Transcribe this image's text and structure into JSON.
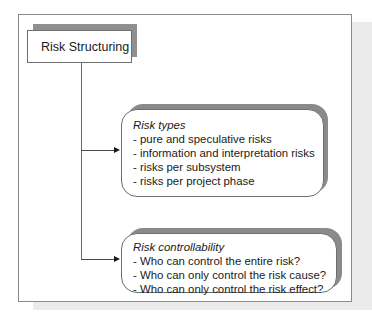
{
  "diagram": {
    "root": {
      "label": "Risk Structuring"
    },
    "nodes": [
      {
        "heading": "Risk types",
        "items": [
          "- pure and speculative risks",
          "- information and interpretation risks",
          "- risks per subsystem",
          "- risks per project phase"
        ]
      },
      {
        "heading": "Risk controllability",
        "items": [
          "- Who can control the entire risk?",
          "- Who can only control the risk cause?",
          "- Who can only control the risk effect?"
        ]
      }
    ],
    "colors": {
      "shadow_dark": "#8a8a8a",
      "shadow_light": "#ebebeb",
      "border": "#6e6e6e",
      "text": "#1a1a1a"
    }
  }
}
